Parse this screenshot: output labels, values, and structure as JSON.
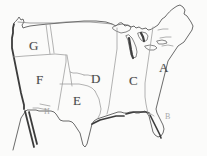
{
  "map": {
    "title": "United States regional outline map",
    "background_color": "#fbfbfa",
    "outline_color": "#555555",
    "shaded_coast_color": "#3a3a3a",
    "internal_border_color": "#8a8a8a",
    "label_color": "#4a4a4a"
  },
  "regions": [
    {
      "id": "region-a",
      "label": "A",
      "name": "northeast-region",
      "x": 159,
      "y": 61,
      "style": "normal"
    },
    {
      "id": "region-b",
      "label": "B",
      "name": "florida-region",
      "x": 165,
      "y": 113,
      "style": "faint"
    },
    {
      "id": "region-c",
      "label": "C",
      "name": "east-central-region",
      "x": 129,
      "y": 74,
      "style": "normal"
    },
    {
      "id": "region-d",
      "label": "D",
      "name": "midwest-plains-region",
      "x": 91,
      "y": 72,
      "style": "normal"
    },
    {
      "id": "region-e",
      "label": "E",
      "name": "south-central-region",
      "x": 73,
      "y": 94,
      "style": "normal"
    },
    {
      "id": "region-f",
      "label": "F",
      "name": "southwest-mountain-region",
      "x": 36,
      "y": 73,
      "style": "normal"
    },
    {
      "id": "region-g",
      "label": "G",
      "name": "pacific-northwest-region",
      "x": 29,
      "y": 39,
      "style": "normal"
    },
    {
      "id": "region-h",
      "label": "H",
      "name": "southern-border-region",
      "x": 44,
      "y": 108,
      "style": "faint"
    }
  ]
}
